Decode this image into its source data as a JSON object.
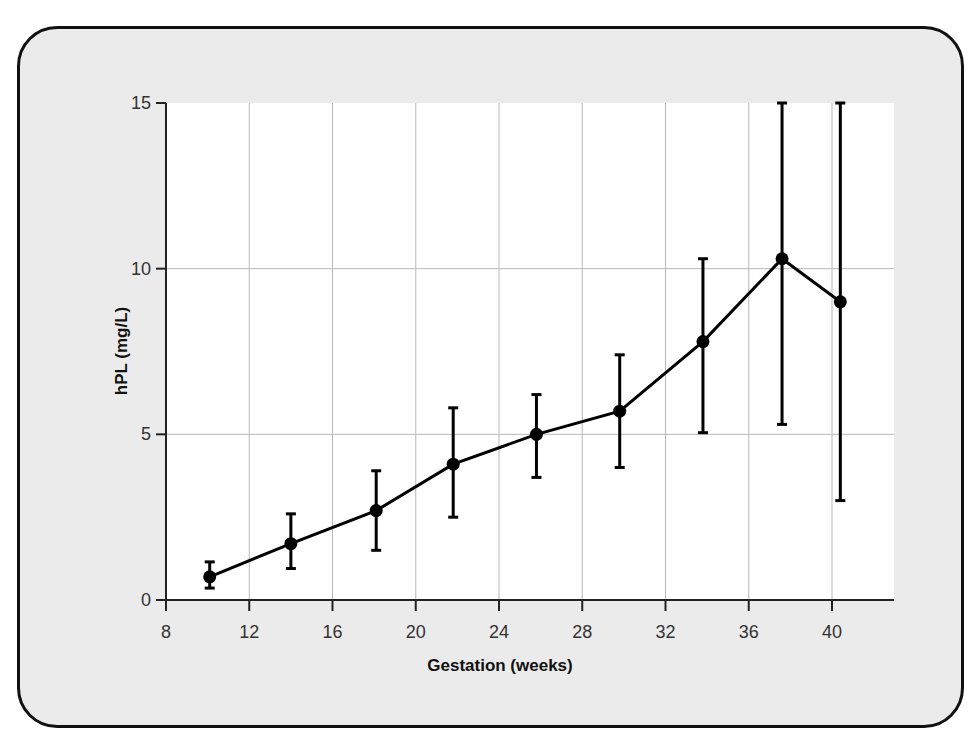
{
  "chart_data": {
    "type": "line",
    "title": "",
    "xlabel": "Gestation (weeks)",
    "ylabel": "hPL (mg/L)",
    "xlim": [
      8,
      43.5
    ],
    "ylim": [
      0,
      15
    ],
    "grid": true,
    "legend": null,
    "x_ticks": [
      8,
      12,
      16,
      20,
      24,
      28,
      32,
      36,
      40
    ],
    "y_ticks": [
      0,
      5,
      10,
      15
    ],
    "series": [
      {
        "name": "hPL",
        "x": [
          10.1,
          14.0,
          18.1,
          21.8,
          25.8,
          29.8,
          33.8,
          37.6,
          40.4
        ],
        "values": [
          0.7,
          1.7,
          2.7,
          4.1,
          5.0,
          5.7,
          7.8,
          10.3,
          9.0
        ],
        "error_upper": [
          1.15,
          2.6,
          3.9,
          5.8,
          6.2,
          7.4,
          10.3,
          15.0,
          15.0
        ],
        "error_lower": [
          0.36,
          0.95,
          1.5,
          2.5,
          3.7,
          4.0,
          5.05,
          5.3,
          3.0
        ]
      }
    ]
  },
  "colors": {
    "frame_background": "#ebebeb",
    "frame_border": "#111111",
    "plot_background": "#ffffff",
    "grid": "#b8b8b8",
    "series": "#000000"
  }
}
